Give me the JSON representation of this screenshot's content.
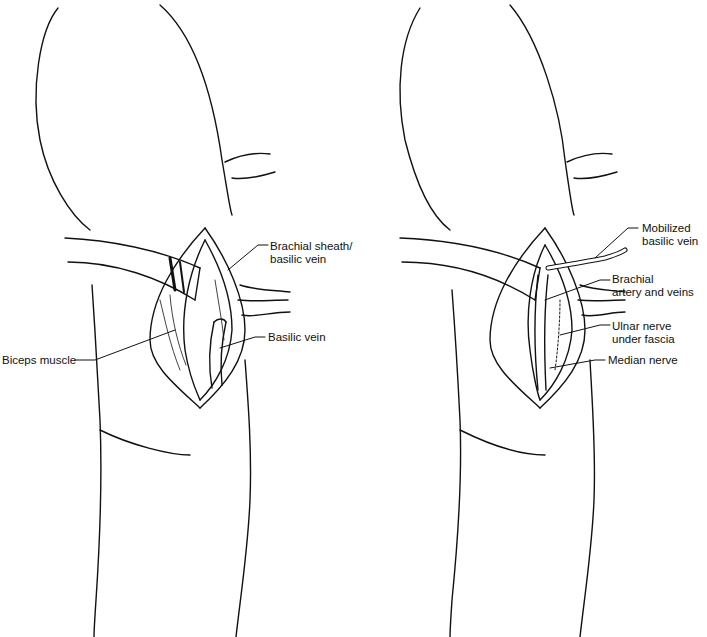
{
  "figure": {
    "panels": [
      {
        "id": "left",
        "labels": [
          {
            "text": "Brachial sheath/\nbasilic vein"
          },
          {
            "text": "Basilic vein"
          },
          {
            "text": "Biceps muscle"
          }
        ]
      },
      {
        "id": "right",
        "labels": [
          {
            "text": "Mobilized\nbasilic vein"
          },
          {
            "text": "Brachial\nartery and veins"
          },
          {
            "text": "Ulnar nerve\nunder fascia"
          },
          {
            "text": "Median nerve"
          }
        ]
      }
    ]
  }
}
